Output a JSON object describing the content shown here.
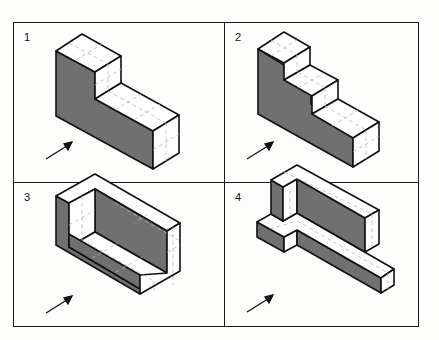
{
  "figure": {
    "panels": [
      {
        "number": "1",
        "shape": "L-block (tall step at back, long low extension)"
      },
      {
        "number": "2",
        "shape": "three-step staircase block"
      },
      {
        "number": "3",
        "shape": "U-channel block with end walls"
      },
      {
        "number": "4",
        "shape": "T-shaped base with tall back wall"
      }
    ],
    "arrow_label": "viewing-direction-arrow",
    "colors": {
      "shaded_face": "#6f6f6f",
      "light_face": "#ffffff",
      "outline": "#111111",
      "grid_dash": "#b5b5b5"
    }
  }
}
